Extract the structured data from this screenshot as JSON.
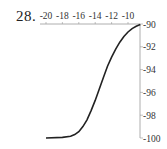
{
  "problem_number": "28.",
  "chart_data": {
    "type": "line",
    "title": "",
    "xlabel": "",
    "ylabel": "",
    "x_axis_position": "top",
    "y_axis_position": "right",
    "x_ticks": [
      -20,
      -18,
      -16,
      -14,
      -12,
      -10
    ],
    "x_tick_labels": [
      "-20",
      "-18",
      "-16",
      "-14",
      "-12",
      "-10"
    ],
    "y_ticks": [
      -90,
      -92,
      -94,
      -96,
      -98,
      -100
    ],
    "y_tick_labels": [
      "-90",
      "-92",
      "-94",
      "-96",
      "-98",
      "-100"
    ],
    "xlim": [
      -20.5,
      -8
    ],
    "ylim": [
      -100,
      -90
    ],
    "grid": false,
    "legend": null,
    "series": [
      {
        "name": "curve",
        "color": "#222222",
        "x": [
          -20.0,
          -18.0,
          -17.0,
          -16.5,
          -16.0,
          -15.5,
          -15.0,
          -14.5,
          -14.0,
          -13.5,
          -13.0,
          -12.5,
          -12.0,
          -11.5,
          -11.0,
          -10.5,
          -10.0,
          -9.5,
          -9.0,
          -8.5
        ],
        "y": [
          -100.0,
          -99.95,
          -99.85,
          -99.7,
          -99.45,
          -99.0,
          -98.4,
          -97.6,
          -96.7,
          -95.7,
          -94.7,
          -93.7,
          -92.9,
          -92.2,
          -91.6,
          -91.1,
          -90.7,
          -90.4,
          -90.2,
          -90.05
        ]
      }
    ]
  }
}
